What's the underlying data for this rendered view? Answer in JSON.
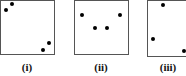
{
  "panels": [
    {
      "label": "(i)",
      "box": {
        "x": 0,
        "y": 0,
        "w": 55,
        "h": 55
      },
      "dots": [
        [
          6,
          10
        ],
        [
          12,
          4
        ],
        [
          43,
          50
        ],
        [
          49,
          43
        ]
      ]
    },
    {
      "label": "(ii)",
      "box": {
        "x": 74,
        "y": 0,
        "w": 55,
        "h": 55
      },
      "dots": [
        [
          82,
          15
        ],
        [
          95,
          28
        ],
        [
          107,
          28
        ],
        [
          120,
          15
        ]
      ]
    },
    {
      "label": "(iii)",
      "box": {
        "x": 147,
        "y": 0,
        "w": 40,
        "h": 57
      },
      "dots": [
        [
          163,
          5
        ],
        [
          153,
          39
        ],
        [
          184,
          51
        ]
      ]
    }
  ]
}
